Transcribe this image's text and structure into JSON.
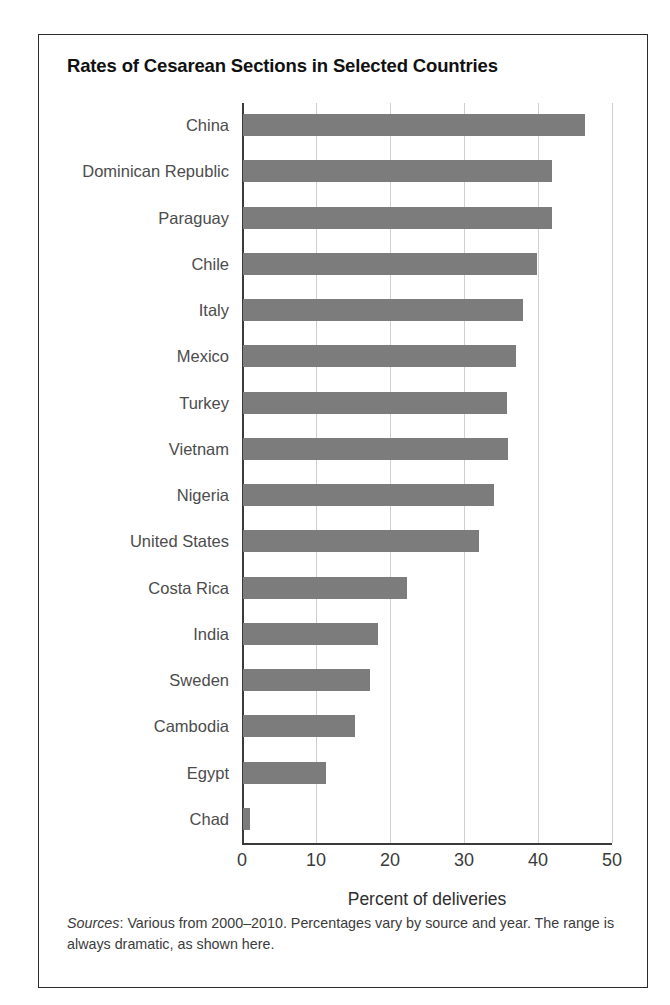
{
  "figure": {
    "title": "Rates of Cesarean Sections in Selected Countries",
    "source_label": "Sources",
    "source_text": ": Various from 2000–2010. Percentages vary by source and year. The range is always dramatic, as shown here."
  },
  "chart_data": {
    "type": "bar",
    "orientation": "horizontal",
    "title": "Rates of Cesarean Sections in Selected Countries",
    "xlabel": "Percent of deliveries",
    "ylabel": "",
    "xlim": [
      0,
      50
    ],
    "xticks": [
      0,
      10,
      20,
      30,
      40,
      50
    ],
    "xtick_labels": [
      "0",
      "10",
      "20",
      "30",
      "40",
      "50"
    ],
    "grid": "vertical",
    "legend": "none",
    "bar_color": "#7c7c7c",
    "categories": [
      "China",
      "Dominican Republic",
      "Paraguay",
      "Chile",
      "Italy",
      "Mexico",
      "Turkey",
      "Vietnam",
      "Nigeria",
      "United States",
      "Costa Rica",
      "India",
      "Sweden",
      "Cambodia",
      "Egypt",
      "Chad"
    ],
    "values": [
      46.2,
      41.8,
      41.8,
      39.7,
      37.9,
      36.9,
      35.7,
      35.8,
      33.9,
      31.9,
      22.2,
      18.2,
      17.2,
      15.2,
      11.2,
      0.9
    ],
    "units": "percent of deliveries",
    "source_note": "Sources: Various from 2000–2010. Percentages vary by source and year. The range is always dramatic, as shown here."
  }
}
